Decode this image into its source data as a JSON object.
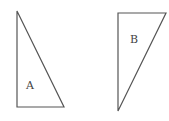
{
  "diagram": {
    "shapes": [
      {
        "id": "A",
        "label": "A",
        "type": "right-triangle",
        "points": [
          [
            17,
            11
          ],
          [
            17,
            107
          ],
          [
            64,
            107
          ]
        ]
      },
      {
        "id": "B",
        "label": "B",
        "type": "right-triangle",
        "points": [
          [
            118,
            13
          ],
          [
            166,
            13
          ],
          [
            118,
            111
          ]
        ]
      }
    ],
    "colors": {
      "stroke": "#555555",
      "background": "#ffffff"
    }
  }
}
